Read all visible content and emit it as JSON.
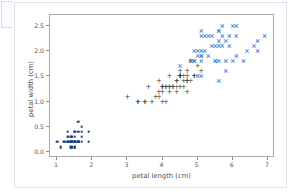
{
  "cell": {
    "gutter_label": "",
    "panel_name": "notebook-output-cell"
  },
  "chart_data": {
    "type": "scatter",
    "title": "",
    "xlabel": "petal length (cm)",
    "ylabel": "petal width (cm)",
    "xlim": [
      0.8,
      7.2
    ],
    "ylim": [
      -0.12,
      2.72
    ],
    "xticks": [
      1,
      2,
      3,
      4,
      5,
      6,
      7
    ],
    "xticklabels": [
      "1",
      "2",
      "3",
      "4",
      "5",
      "6",
      "7"
    ],
    "yticks": [
      0.0,
      0.5,
      1.0,
      1.5,
      2.0,
      2.5
    ],
    "yticklabels": [
      "0.0",
      "0.5",
      "1.0",
      "1.5",
      "2.0",
      "2.5"
    ],
    "grid": false,
    "legend": "none",
    "colors": {
      "setosa": "#1f3f7a",
      "versicolor": "#3a3a3a",
      "virginica": "#3f7fd0",
      "axes_frame": "#a9a9a9",
      "tick": "#8c8c8c",
      "label_text": "#4c5055",
      "background": "#ffffff",
      "panel_border": "#dbe3ee"
    },
    "series": [
      {
        "name": "setosa",
        "marker": "square",
        "color": "#1f3f7a",
        "x": [
          1.4,
          1.4,
          1.3,
          1.5,
          1.4,
          1.7,
          1.4,
          1.5,
          1.4,
          1.5,
          1.5,
          1.6,
          1.4,
          1.1,
          1.2,
          1.5,
          1.3,
          1.4,
          1.7,
          1.5,
          1.7,
          1.5,
          1.0,
          1.7,
          1.9,
          1.6,
          1.6,
          1.5,
          1.4,
          1.6,
          1.6,
          1.5,
          1.5,
          1.4,
          1.5,
          1.2,
          1.3,
          1.4,
          1.3,
          1.5,
          1.3,
          1.3,
          1.3,
          1.6,
          1.9,
          1.4,
          1.6,
          1.4,
          1.5,
          1.4
        ],
        "y": [
          0.2,
          0.2,
          0.2,
          0.2,
          0.2,
          0.4,
          0.3,
          0.2,
          0.2,
          0.1,
          0.2,
          0.2,
          0.1,
          0.1,
          0.2,
          0.4,
          0.4,
          0.3,
          0.3,
          0.3,
          0.2,
          0.4,
          0.2,
          0.5,
          0.2,
          0.2,
          0.4,
          0.2,
          0.2,
          0.2,
          0.2,
          0.4,
          0.1,
          0.2,
          0.2,
          0.2,
          0.2,
          0.1,
          0.2,
          0.2,
          0.3,
          0.3,
          0.2,
          0.6,
          0.4,
          0.3,
          0.2,
          0.2,
          0.2,
          0.2
        ]
      },
      {
        "name": "versicolor",
        "marker": "plus",
        "color": "#3a3a3a",
        "x": [
          4.7,
          4.5,
          4.9,
          4.0,
          4.6,
          4.5,
          4.7,
          3.3,
          4.6,
          3.9,
          3.5,
          4.2,
          4.0,
          4.7,
          3.6,
          4.4,
          4.5,
          4.1,
          4.5,
          3.9,
          4.8,
          4.0,
          4.9,
          4.7,
          4.3,
          4.4,
          4.8,
          5.0,
          4.5,
          3.5,
          3.8,
          3.7,
          3.9,
          5.1,
          4.5,
          4.5,
          4.7,
          4.4,
          4.1,
          4.0,
          4.4,
          4.6,
          4.0,
          3.3,
          4.2,
          4.2,
          4.2,
          4.3,
          3.0,
          4.1
        ],
        "y": [
          1.4,
          1.5,
          1.5,
          1.3,
          1.5,
          1.3,
          1.6,
          1.0,
          1.3,
          1.4,
          1.0,
          1.5,
          1.0,
          1.4,
          1.3,
          1.4,
          1.5,
          1.0,
          1.5,
          1.1,
          1.8,
          1.3,
          1.5,
          1.2,
          1.3,
          1.4,
          1.4,
          1.7,
          1.5,
          1.0,
          1.1,
          1.0,
          1.2,
          1.6,
          1.5,
          1.6,
          1.5,
          1.3,
          1.3,
          1.3,
          1.2,
          1.4,
          1.2,
          1.0,
          1.3,
          1.2,
          1.3,
          1.3,
          1.1,
          1.3
        ]
      },
      {
        "name": "virginica",
        "marker": "x",
        "color": "#3f7fd0",
        "x": [
          6.0,
          5.1,
          5.9,
          5.6,
          5.8,
          6.6,
          4.5,
          6.3,
          5.8,
          6.1,
          5.1,
          5.3,
          5.5,
          5.0,
          5.1,
          5.3,
          5.5,
          6.7,
          6.9,
          5.0,
          5.7,
          4.9,
          6.7,
          4.9,
          5.7,
          6.0,
          4.8,
          4.9,
          5.6,
          5.8,
          6.1,
          6.4,
          5.6,
          5.1,
          5.6,
          6.1,
          5.6,
          5.5,
          4.8,
          5.4,
          5.6,
          5.1,
          5.1,
          5.9,
          5.7,
          5.2,
          5.0,
          5.2,
          5.4,
          5.1
        ],
        "y": [
          2.5,
          1.9,
          2.1,
          1.8,
          2.2,
          2.1,
          1.7,
          1.8,
          1.8,
          2.5,
          2.0,
          1.9,
          2.1,
          2.0,
          2.4,
          2.3,
          1.8,
          2.2,
          2.3,
          1.5,
          2.3,
          2.0,
          2.0,
          1.8,
          2.1,
          1.8,
          1.8,
          1.8,
          2.1,
          1.6,
          1.9,
          2.0,
          2.2,
          1.5,
          1.4,
          2.3,
          2.4,
          1.8,
          1.8,
          2.1,
          2.4,
          2.3,
          1.9,
          2.3,
          2.5,
          2.3,
          1.9,
          2.0,
          2.3,
          1.8
        ]
      }
    ]
  }
}
